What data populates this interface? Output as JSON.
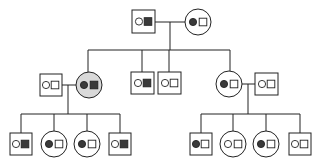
{
  "diagram": {
    "type": "pedigree",
    "colors": {
      "line": "#222222",
      "allele_filled": "#3a3a3a",
      "highlight_fill": "#d9d9d9",
      "background": "#ffffff"
    },
    "legend_note": "Each individual shows two alleles: circle allele and square allele; filled = dark, open = white",
    "individuals": [
      {
        "id": "I-1",
        "sex": "male",
        "alleles": [
          "open-circle",
          "filled-square"
        ],
        "highlight": false
      },
      {
        "id": "I-2",
        "sex": "female",
        "alleles": [
          "filled-circle",
          "open-square"
        ],
        "highlight": false
      },
      {
        "id": "II-1",
        "sex": "male",
        "alleles": [
          "open-circle",
          "open-square"
        ],
        "highlight": false,
        "spouse_of": "II-2"
      },
      {
        "id": "II-2",
        "sex": "female",
        "alleles": [
          "filled-circle",
          "filled-square"
        ],
        "highlight": true
      },
      {
        "id": "II-3",
        "sex": "male",
        "alleles": [
          "open-circle",
          "filled-square"
        ],
        "highlight": false
      },
      {
        "id": "II-4",
        "sex": "male",
        "alleles": [
          "open-circle",
          "open-square"
        ],
        "highlight": false
      },
      {
        "id": "II-5",
        "sex": "female",
        "alleles": [
          "filled-circle",
          "open-square"
        ],
        "highlight": false
      },
      {
        "id": "II-6",
        "sex": "male",
        "alleles": [
          "open-circle",
          "open-square"
        ],
        "highlight": false,
        "spouse_of": "II-5"
      },
      {
        "id": "III-1",
        "sex": "male",
        "alleles": [
          "open-circle",
          "filled-square"
        ],
        "highlight": false
      },
      {
        "id": "III-2",
        "sex": "female",
        "alleles": [
          "filled-circle",
          "open-square"
        ],
        "highlight": false
      },
      {
        "id": "III-3",
        "sex": "female",
        "alleles": [
          "filled-circle",
          "open-square"
        ],
        "highlight": false
      },
      {
        "id": "III-4",
        "sex": "male",
        "alleles": [
          "open-circle",
          "filled-square"
        ],
        "highlight": false
      },
      {
        "id": "III-5",
        "sex": "male",
        "alleles": [
          "filled-circle",
          "open-square"
        ],
        "highlight": false
      },
      {
        "id": "III-6",
        "sex": "female",
        "alleles": [
          "open-circle",
          "open-square"
        ],
        "highlight": false
      },
      {
        "id": "III-7",
        "sex": "female",
        "alleles": [
          "filled-circle",
          "open-square"
        ],
        "highlight": false
      },
      {
        "id": "III-8",
        "sex": "male",
        "alleles": [
          "open-circle",
          "open-square"
        ],
        "highlight": false
      }
    ]
  }
}
